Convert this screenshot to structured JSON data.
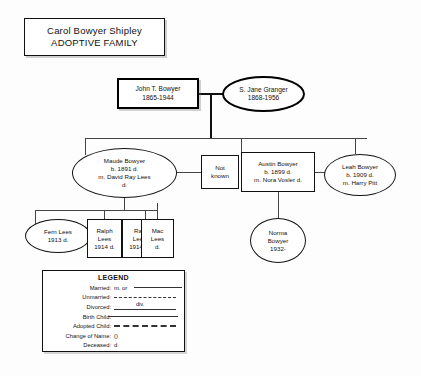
{
  "title": {
    "line1": "Carol Bowyer Shipley",
    "line2": "ADOPTIVE FAMILY"
  },
  "generation1": {
    "father": {
      "name": "John T. Bowyer",
      "dates": "1865-1944"
    },
    "mother": {
      "name": "S. Jane Granger",
      "dates": "1868-1956"
    }
  },
  "generation2": {
    "maude": {
      "line1": "Maude Bowyer",
      "line2": "b. 1891 d.",
      "line3": "m. David Ray Lees",
      "line4": "d."
    },
    "unknown": {
      "line1": "Not",
      "line2": "known"
    },
    "austin": {
      "line1": "Austin Bowyer",
      "line2": "b. 1899 d.",
      "line3": "m. Nora Vosler d."
    },
    "leah": {
      "line1": "Leah Bowyer",
      "line2": "b. 1909 d.",
      "line3": "m. Harry Pitt"
    }
  },
  "generation3": {
    "fern": {
      "line1": "Fern Lees",
      "line2": "1913 d."
    },
    "ralph": {
      "line1": "Ralph",
      "line2": "Lees",
      "line3": "1914 d."
    },
    "ray": {
      "line1": "Ray",
      "line2": "Lees",
      "line3": "1914 d."
    },
    "mac": {
      "line1": "Mac",
      "line2": "Lees",
      "line3": "d."
    },
    "norma": {
      "line1": "Norma",
      "line2": "Bowyer",
      "line3": "1932-"
    }
  },
  "legend": {
    "title": "LEGEND",
    "rows": [
      {
        "label": "Married:",
        "sample_text": "m. or",
        "style": "solid"
      },
      {
        "label": "Unmarried:",
        "sample_text": "",
        "style": "dashdot"
      },
      {
        "label": "Divorced:",
        "sample_text": "div.",
        "style": "solid"
      },
      {
        "label": "Birth Child:",
        "sample_text": "",
        "style": "solid"
      },
      {
        "label": "Adopted Child:",
        "sample_text": "",
        "style": "dashed"
      },
      {
        "label": "Change of Name:",
        "sample_text": "()",
        "style": "none"
      },
      {
        "label": "Deceased:",
        "sample_text": "d.",
        "style": "none"
      }
    ]
  }
}
